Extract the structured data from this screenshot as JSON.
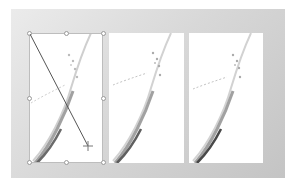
{
  "canvas": {
    "frame_color": "#d4d4d4",
    "panel_background": "#ffffff",
    "panels": [
      {
        "id": "panel-1",
        "selected": true,
        "content": "grass-stem-photo"
      },
      {
        "id": "panel-2",
        "selected": false,
        "content": "grass-stem-photo"
      },
      {
        "id": "panel-3",
        "selected": false,
        "content": "grass-stem-photo"
      }
    ]
  },
  "selection": {
    "target": "panel-1",
    "handle_count": 8
  },
  "drawing": {
    "tool": "line",
    "line_color": "#555555",
    "start": [
      29,
      33
    ],
    "end": [
      88,
      146
    ],
    "cursor": "crosshair"
  }
}
